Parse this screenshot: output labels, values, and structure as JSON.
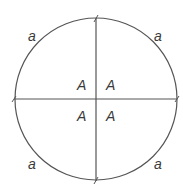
{
  "diagram": {
    "arc_labels": [
      "a",
      "a",
      "a",
      "a"
    ],
    "angle_labels": [
      "A",
      "A",
      "A",
      "A"
    ],
    "stroke_color": "#555555",
    "text_color": "#3a3a3a"
  }
}
